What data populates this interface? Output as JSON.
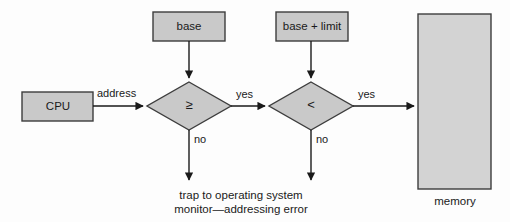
{
  "diagram": {
    "colors": {
      "box_fill": "#c9c9c9",
      "box_stroke": "#3d3d3d",
      "line": "#1a1a1a",
      "text": "#1a1a1a",
      "background": "#fdfdfd"
    },
    "nodes": {
      "cpu": {
        "label": "CPU",
        "shape": "rectangle"
      },
      "base": {
        "label": "base",
        "shape": "rectangle"
      },
      "base_limit": {
        "label": "base + limit",
        "shape": "rectangle"
      },
      "compare_ge": {
        "label": "≥",
        "shape": "diamond"
      },
      "compare_lt": {
        "label": "<",
        "shape": "diamond"
      },
      "memory": {
        "label": "memory",
        "shape": "rectangle"
      }
    },
    "edge_labels": {
      "address": "address",
      "yes_first": "yes",
      "yes_second": "yes",
      "no_first": "no",
      "no_second": "no"
    },
    "trap_text": {
      "line1": "trap to operating system",
      "line2": "monitor—addressing error"
    }
  }
}
